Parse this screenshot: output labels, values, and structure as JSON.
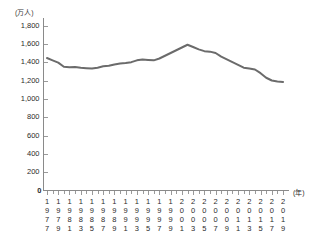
{
  "chart_data": {
    "type": "line",
    "title": "",
    "subtitle": "",
    "ylabel": "(万人)",
    "xlabel": "(年)",
    "ylim": [
      0,
      1800
    ],
    "ytick_values": [
      0,
      200,
      400,
      600,
      800,
      1000,
      1200,
      1400,
      1600,
      1800
    ],
    "ytick_labels": [
      "0",
      "200",
      "400",
      "600",
      "800",
      "1,000",
      "1,200",
      "1,400",
      "1,600",
      "1,800"
    ],
    "grid": false,
    "legend": null,
    "line_color": "#6b6b6b",
    "x": [
      1977,
      1978,
      1979,
      1980,
      1981,
      1982,
      1983,
      1984,
      1985,
      1986,
      1987,
      1988,
      1989,
      1990,
      1991,
      1992,
      1993,
      1994,
      1995,
      1996,
      1997,
      1998,
      1999,
      2000,
      2001,
      2002,
      2003,
      2004,
      2005,
      2006,
      2007,
      2008,
      2009,
      2010,
      2011,
      2012,
      2013,
      2014,
      2015,
      2016,
      2017,
      2018,
      2019
    ],
    "values": [
      1445,
      1420,
      1395,
      1350,
      1345,
      1348,
      1340,
      1335,
      1330,
      1340,
      1355,
      1360,
      1375,
      1385,
      1390,
      1400,
      1420,
      1430,
      1425,
      1420,
      1440,
      1470,
      1500,
      1530,
      1560,
      1590,
      1565,
      1540,
      1520,
      1515,
      1500,
      1460,
      1430,
      1400,
      1370,
      1340,
      1330,
      1320,
      1280,
      1230,
      1200,
      1190,
      1185
    ],
    "xtick_labels_shown": [
      "1977",
      "1979",
      "1981",
      "1983",
      "1985",
      "1987",
      "1989",
      "1991",
      "1993",
      "1995",
      "1997",
      "1999",
      "2001",
      "2003",
      "2005",
      "2007",
      "2009",
      "2011",
      "2013",
      "2015",
      "2017",
      "2019"
    ],
    "xtick_digits": [
      [
        "1",
        "9",
        "7",
        "7"
      ],
      [
        "1",
        "9",
        "7",
        "9"
      ],
      [
        "1",
        "9",
        "8",
        "1"
      ],
      [
        "1",
        "9",
        "8",
        "3"
      ],
      [
        "1",
        "9",
        "8",
        "5"
      ],
      [
        "1",
        "9",
        "8",
        "7"
      ],
      [
        "1",
        "9",
        "8",
        "9"
      ],
      [
        "1",
        "9",
        "9",
        "1"
      ],
      [
        "1",
        "9",
        "9",
        "3"
      ],
      [
        "1",
        "9",
        "9",
        "5"
      ],
      [
        "1",
        "9",
        "9",
        "7"
      ],
      [
        "1",
        "9",
        "9",
        "9"
      ],
      [
        "2",
        "0",
        "0",
        "1"
      ],
      [
        "2",
        "0",
        "0",
        "3"
      ],
      [
        "2",
        "0",
        "0",
        "5"
      ],
      [
        "2",
        "0",
        "0",
        "7"
      ],
      [
        "2",
        "0",
        "0",
        "9"
      ],
      [
        "2",
        "0",
        "1",
        "1"
      ],
      [
        "2",
        "0",
        "1",
        "3"
      ],
      [
        "2",
        "0",
        "1",
        "5"
      ],
      [
        "2",
        "0",
        "1",
        "7"
      ],
      [
        "2",
        "0",
        "1",
        "9"
      ]
    ]
  }
}
